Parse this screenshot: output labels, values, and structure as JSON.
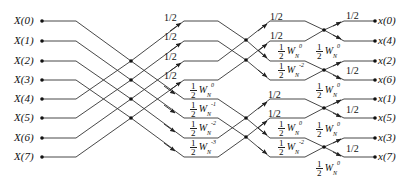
{
  "diagram": {
    "type": "radix-2 decimation-in-frequency IFFT butterfly (N=8)",
    "inputs": [
      "X(0)",
      "X(1)",
      "X(2)",
      "X(3)",
      "X(4)",
      "X(5)",
      "X(6)",
      "X(7)"
    ],
    "outputs": [
      "x(0)",
      "x(4)",
      "x(2)",
      "x(6)",
      "x(1)",
      "x(5)",
      "x(3)",
      "x(7)"
    ],
    "half_label": "1/2",
    "twiddle_one_half": "1",
    "twiddle_den": "2",
    "twiddle_base": "W",
    "twiddle_sub": "N",
    "stage1": {
      "upper_labels": [
        "1/2",
        "1/2",
        "1/2",
        "1/2"
      ],
      "lower_exponents": [
        "0",
        "-1",
        "-2",
        "-3"
      ]
    },
    "stage2": {
      "upper_labels": [
        "1/2",
        "1/2",
        "1/2",
        "1/2"
      ],
      "lower_exponents": [
        "0",
        "-2",
        "0",
        "-2"
      ]
    },
    "stage3": {
      "upper_labels": [
        "1/2",
        "1/2",
        "1/2",
        "1/2"
      ],
      "lower_exponents": [
        "0",
        "0",
        "0",
        "0"
      ]
    },
    "colors": {
      "line": "#222222",
      "text": "#111111",
      "background": "#ffffff"
    }
  }
}
